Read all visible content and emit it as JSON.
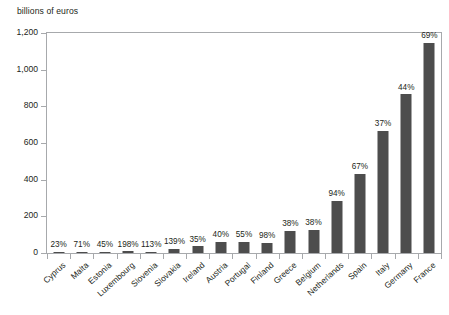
{
  "chart_data": {
    "type": "bar",
    "title": "",
    "subtitle": "",
    "ylabel": "billions of euros",
    "xlabel": "",
    "ylim": [
      0,
      1200
    ],
    "yticks": [
      0,
      200,
      400,
      600,
      800,
      1000,
      1200
    ],
    "ytick_labels": [
      "0",
      "200",
      "400",
      "600",
      "800",
      "1,000",
      "1,200"
    ],
    "grid": false,
    "legend": null,
    "categories": [
      "Cyprus",
      "Malta",
      "Estonia",
      "Luxembourg",
      "Slovenia",
      "Slovakia",
      "Ireland",
      "Austria",
      "Portugal",
      "Finland",
      "Greece",
      "Belgium",
      "Netherlands",
      "Spain",
      "Italy",
      "Germany",
      "France"
    ],
    "values": [
      3,
      4,
      2,
      9,
      7,
      22,
      37,
      60,
      60,
      56,
      120,
      125,
      285,
      430,
      665,
      865,
      1145
    ],
    "data_labels": [
      "23%",
      "71%",
      "45%",
      "198%",
      "113%",
      "139%",
      "35%",
      "40%",
      "55%",
      "98%",
      "38%",
      "38%",
      "94%",
      "67%",
      "37%",
      "44%",
      "69%"
    ],
    "series": [
      {
        "name": "billions of euros",
        "values": [
          3,
          4,
          2,
          9,
          7,
          22,
          37,
          60,
          60,
          56,
          120,
          125,
          285,
          430,
          665,
          865,
          1145
        ]
      }
    ],
    "colors": {
      "bar": "#4d4d4d",
      "axis": "#a7a9ac",
      "text": "#231f20",
      "background": "#ffffff"
    }
  }
}
